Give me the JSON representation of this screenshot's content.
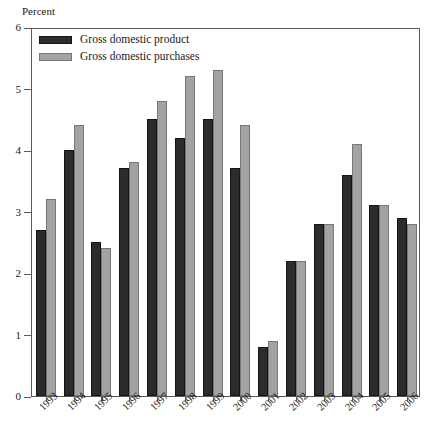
{
  "chart_data": {
    "type": "bar",
    "title": "",
    "subtitle": "",
    "xlabel": "",
    "ylabel": "Percent",
    "ylim": [
      0,
      6
    ],
    "yticks": [
      0,
      1,
      2,
      3,
      4,
      5,
      6
    ],
    "ytick_labels": [
      "0",
      "1",
      "2",
      "3",
      "4",
      "5",
      "6"
    ],
    "grid": false,
    "legend_position": "top-left",
    "categories": [
      "1993",
      "1994",
      "1995",
      "1996",
      "1997",
      "1998",
      "1999",
      "2000",
      "2001",
      "2002",
      "2003",
      "2004",
      "2005",
      "2006"
    ],
    "series": [
      {
        "name": "Gross domestic product",
        "color": "#2c2c2c",
        "values": [
          2.7,
          4.0,
          2.5,
          3.7,
          4.5,
          4.2,
          4.5,
          3.7,
          0.8,
          2.2,
          2.8,
          3.6,
          3.1,
          2.9
        ]
      },
      {
        "name": "Gross domestic purchases",
        "color": "#a3a3a3",
        "values": [
          3.2,
          4.4,
          2.4,
          3.8,
          4.8,
          5.2,
          5.3,
          4.4,
          0.9,
          2.2,
          2.8,
          4.1,
          3.1,
          2.8
        ]
      }
    ]
  },
  "axis": {
    "y_title": "Percent"
  },
  "legend": {
    "items": [
      {
        "label": "Gross domestic product"
      },
      {
        "label": "Gross domestic purchases"
      }
    ]
  }
}
